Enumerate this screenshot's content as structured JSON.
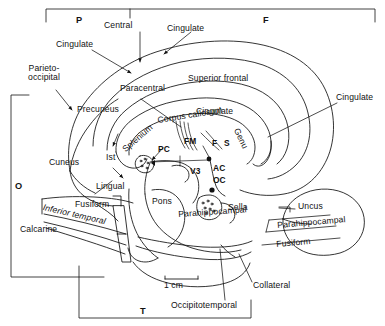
{
  "figure": {
    "type": "anatomical-diagram",
    "scale_bar": {
      "label": "1 cm",
      "length_px": 33
    },
    "ink_color": "#111111",
    "background_color": "#ffffff"
  },
  "lobe_brackets": [
    {
      "key": "P",
      "label": "P",
      "meaning": "Parietal",
      "orientation": "top"
    },
    {
      "key": "F",
      "label": "F",
      "meaning": "Frontal",
      "orientation": "top"
    },
    {
      "key": "O",
      "label": "O",
      "meaning": "Occipital",
      "orientation": "left"
    },
    {
      "key": "T",
      "label": "T",
      "meaning": "Temporal",
      "orientation": "bottom"
    }
  ],
  "sulci_labels": [
    {
      "id": "central",
      "text": "Central"
    },
    {
      "id": "cingulate_top",
      "text": "Cingulate"
    },
    {
      "id": "cingulate_left",
      "text": "Cingulate"
    },
    {
      "id": "cingulate_right",
      "text": "Cingulate"
    },
    {
      "id": "parieto_occipital",
      "text": "Parieto-\noccipital",
      "line1": "Parieto-",
      "line2": "occipital"
    },
    {
      "id": "calcarine",
      "text": "Calcarine"
    },
    {
      "id": "collateral",
      "text": "Collateral"
    },
    {
      "id": "occipitotemporal",
      "text": "Occipitotemporal"
    }
  ],
  "gyri_labels": [
    {
      "id": "paracentral",
      "text": "Paracentral"
    },
    {
      "id": "superior_frontal",
      "text": "Superior frontal"
    },
    {
      "id": "precuneus",
      "text": "Precuneus"
    },
    {
      "id": "cingulate_gyrus",
      "text": "Cingulate"
    },
    {
      "id": "cuneus",
      "text": "Cuneus"
    },
    {
      "id": "lingual",
      "text": "Lingual"
    },
    {
      "id": "fusiform",
      "text": "Fusiform"
    },
    {
      "id": "inferior_temporal",
      "text": "Inferior temporal"
    },
    {
      "id": "parahippocampal",
      "text": "Parahippocampal"
    }
  ],
  "structure_labels": [
    {
      "id": "corpus_callosum",
      "text": "Corpus callosum"
    },
    {
      "id": "splenium",
      "text": "Splenium"
    },
    {
      "id": "genu",
      "text": "Genu"
    },
    {
      "id": "isthmus",
      "text": "Ist",
      "meaning": "Isthmus"
    },
    {
      "id": "pons",
      "text": "Pons"
    },
    {
      "id": "sella",
      "text": "Sella"
    }
  ],
  "abbreviations": [
    {
      "id": "pc",
      "text": "PC",
      "meaning": "Posterior commissure"
    },
    {
      "id": "fm",
      "text": "FM",
      "meaning": "Foramen of Monro"
    },
    {
      "id": "f",
      "text": "F",
      "meaning": "Fornix"
    },
    {
      "id": "s",
      "text": "S",
      "meaning": "Septum"
    },
    {
      "id": "v3",
      "text": "V3",
      "meaning": "Third ventricle"
    },
    {
      "id": "ac",
      "text": "AC",
      "meaning": "Anterior commissure"
    },
    {
      "id": "oc",
      "text": "OC",
      "meaning": "Optic chiasm"
    }
  ],
  "inset": {
    "id": "temporal-inset",
    "description": "Coronal inset of the medial temporal lobe",
    "labels": [
      {
        "id": "uncus",
        "text": "Uncus"
      },
      {
        "id": "parahippocampal",
        "text": "Parahippocampal"
      },
      {
        "id": "fusiform",
        "text": "Fusiform"
      }
    ]
  }
}
